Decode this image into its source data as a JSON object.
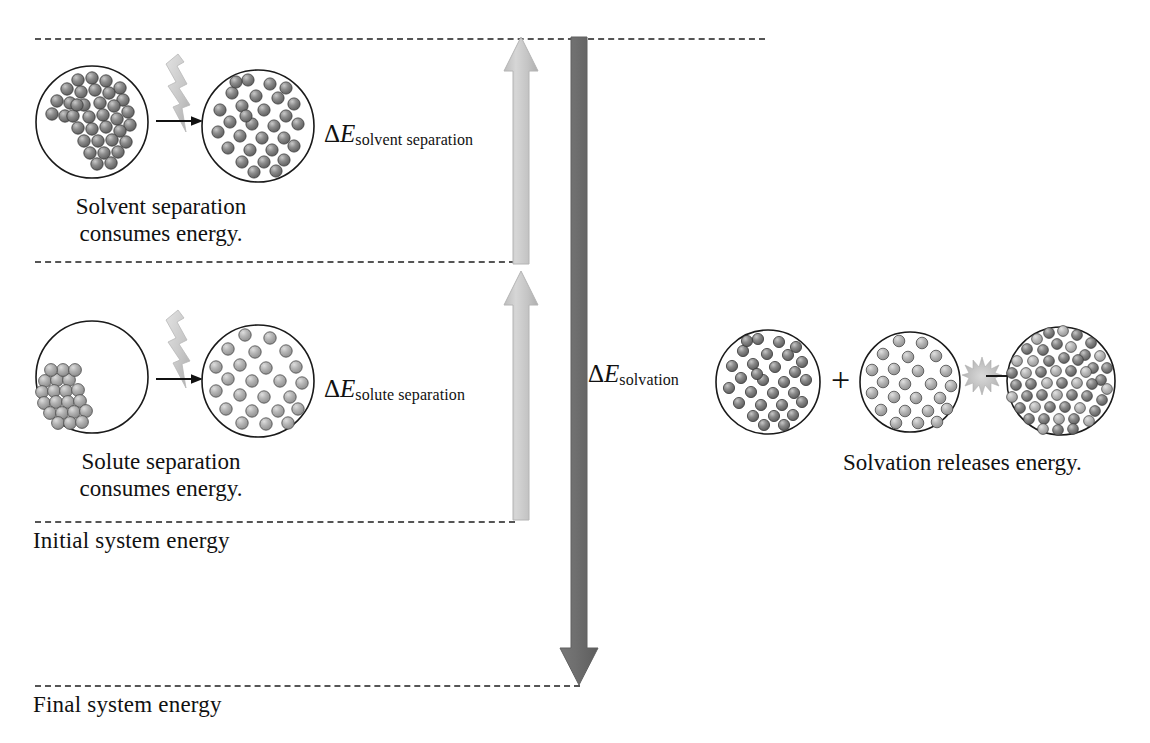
{
  "diagram": {
    "type": "energy-level-diagram",
    "colors": {
      "solvent_sphere": "#808080",
      "solute_sphere": "#b0b0b0",
      "up_arrow": "#c8c8c8",
      "down_arrow": "#6b6b6b",
      "dashed_line": "#555555",
      "outline": "#1a1a1a",
      "background": "#ffffff"
    }
  },
  "energy_levels": [
    {
      "id": "top",
      "label": "",
      "y": 38
    },
    {
      "id": "after_solute_separation",
      "label": "",
      "y": 261
    },
    {
      "id": "initial",
      "label": "Initial system energy",
      "y": 521
    },
    {
      "id": "final",
      "label": "Final system energy",
      "y": 685
    }
  ],
  "labels": {
    "initial_system_energy": "Initial system energy",
    "final_system_energy": "Final system energy"
  },
  "steps": [
    {
      "id": "solvent-separation",
      "delta_symbol": "Δ",
      "delta_variable": "E",
      "delta_subscript": "solvent separation",
      "caption_line1": "Solvent separation",
      "caption_line2": "consumes energy.",
      "direction": "up",
      "energy_sign": "positive",
      "before_state": "pure solvent, densely packed molecules",
      "after_state": "separated solvent molecules",
      "spark_icon": "lightning-bolt-icon",
      "transform_icon": "right-arrow-icon"
    },
    {
      "id": "solute-separation",
      "delta_symbol": "Δ",
      "delta_variable": "E",
      "delta_subscript": "solute separation",
      "caption_line1": "Solute separation",
      "caption_line2": "consumes energy.",
      "direction": "up",
      "energy_sign": "positive",
      "before_state": "solute crystal lattice cluster",
      "after_state": "dispersed solute particles",
      "spark_icon": "lightning-bolt-icon",
      "transform_icon": "right-arrow-icon"
    },
    {
      "id": "solvation",
      "delta_symbol": "Δ",
      "delta_variable": "E",
      "delta_subscript": "solvation",
      "caption_line1": "Solvation releases energy.",
      "direction": "down",
      "energy_sign": "negative",
      "operator": "+",
      "before_state_a": "separated solvent",
      "before_state_b": "separated solute",
      "after_state": "solution, solute solvated by solvent",
      "spark_icon": "energy-burst-icon",
      "transform_icon": "right-arrow-icon"
    }
  ],
  "arrows": {
    "solvent_separation_arrow": {
      "from_level": "after_solute_separation",
      "to_level": "top",
      "direction": "up",
      "color": "#c8c8c8"
    },
    "solute_separation_arrow": {
      "from_level": "initial",
      "to_level": "after_solute_separation",
      "direction": "up",
      "color": "#c8c8c8"
    },
    "solvation_arrow": {
      "from_level": "top",
      "to_level": "final",
      "direction": "down",
      "color": "#6b6b6b"
    }
  }
}
